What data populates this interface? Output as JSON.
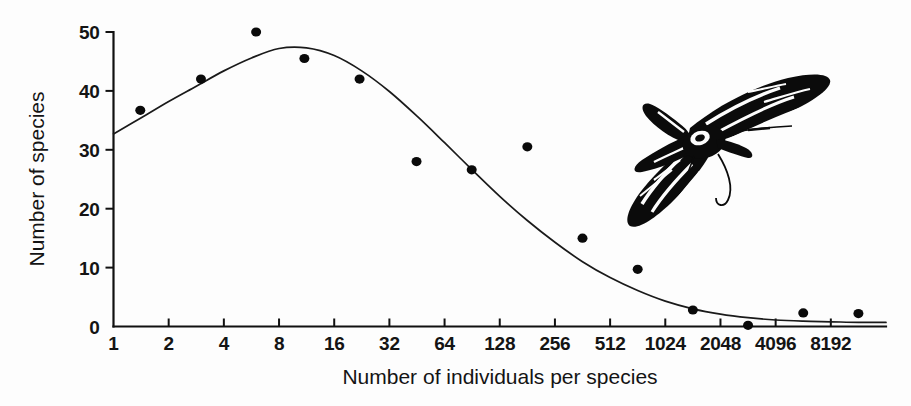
{
  "figure": {
    "background_color": "#fdfdfd",
    "ink_color": "#111111"
  },
  "illustration": {
    "name": "moth-illustration",
    "subject": "hawk moth in flight, black and white line engraving with striped wings"
  },
  "chart_data": {
    "type": "scatter",
    "title": "",
    "subtitle": "",
    "xlabel": "Number of individuals per species",
    "ylabel": "Number of species",
    "x_scale": "log2",
    "y_scale": "linear",
    "xlim": [
      1,
      16384
    ],
    "ylim": [
      0,
      50
    ],
    "grid": false,
    "legend": null,
    "x_tick_labels": [
      "1",
      "2",
      "4",
      "8",
      "16",
      "32",
      "64",
      "128",
      "256",
      "512",
      "1024",
      "2048",
      "4096",
      "8192"
    ],
    "x_tick_values": [
      1,
      2,
      4,
      8,
      16,
      32,
      64,
      128,
      256,
      512,
      1024,
      2048,
      4096,
      8192
    ],
    "y_tick_labels": [
      "0",
      "10",
      "20",
      "30",
      "40",
      "50"
    ],
    "y_tick_values": [
      0,
      10,
      20,
      30,
      40,
      50
    ],
    "series": [
      {
        "name": "Observed species counts",
        "marker": "filled-circle",
        "color": "#0a0a0a",
        "points": [
          {
            "x": 1.4,
            "y": 36.7
          },
          {
            "x": 3.0,
            "y": 42.0
          },
          {
            "x": 6.0,
            "y": 50.0
          },
          {
            "x": 11.0,
            "y": 45.5
          },
          {
            "x": 22.0,
            "y": 42.0
          },
          {
            "x": 45.0,
            "y": 28.0
          },
          {
            "x": 90.0,
            "y": 26.6
          },
          {
            "x": 181.0,
            "y": 30.5
          },
          {
            "x": 362.0,
            "y": 15.0
          },
          {
            "x": 724.0,
            "y": 9.7
          },
          {
            "x": 1448.0,
            "y": 2.8
          },
          {
            "x": 2896.0,
            "y": 0.2
          },
          {
            "x": 5793.0,
            "y": 2.3
          },
          {
            "x": 11585.0,
            "y": 2.2
          }
        ]
      },
      {
        "name": "Fitted lognormal curve",
        "marker": "none",
        "color": "#1a1a1a",
        "points": [
          {
            "x": 1.0,
            "y": 32.7
          },
          {
            "x": 1.41,
            "y": 35.4
          },
          {
            "x": 2.0,
            "y": 38.2
          },
          {
            "x": 2.83,
            "y": 40.8
          },
          {
            "x": 4.0,
            "y": 43.4
          },
          {
            "x": 5.66,
            "y": 45.6
          },
          {
            "x": 8.0,
            "y": 47.2
          },
          {
            "x": 11.3,
            "y": 47.3
          },
          {
            "x": 16.0,
            "y": 46.0
          },
          {
            "x": 22.6,
            "y": 43.4
          },
          {
            "x": 32.0,
            "y": 39.9
          },
          {
            "x": 45.3,
            "y": 35.7
          },
          {
            "x": 64.0,
            "y": 31.2
          },
          {
            "x": 90.5,
            "y": 26.6
          },
          {
            "x": 128.0,
            "y": 22.1
          },
          {
            "x": 181.0,
            "y": 18.0
          },
          {
            "x": 256.0,
            "y": 14.3
          },
          {
            "x": 362.0,
            "y": 11.0
          },
          {
            "x": 512.0,
            "y": 8.3
          },
          {
            "x": 724.0,
            "y": 6.1
          },
          {
            "x": 1024.0,
            "y": 4.3
          },
          {
            "x": 1448.0,
            "y": 3.0
          },
          {
            "x": 2048.0,
            "y": 2.1
          },
          {
            "x": 2896.0,
            "y": 1.5
          },
          {
            "x": 4096.0,
            "y": 1.1
          },
          {
            "x": 5793.0,
            "y": 0.9
          },
          {
            "x": 8192.0,
            "y": 0.8
          },
          {
            "x": 11585.0,
            "y": 0.7
          },
          {
            "x": 16384.0,
            "y": 0.7
          }
        ]
      }
    ]
  }
}
